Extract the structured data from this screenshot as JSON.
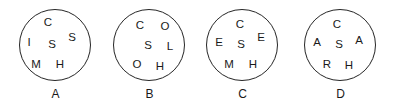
{
  "board": {
    "title": "Letter circles puzzle",
    "background_color": "#ffffff",
    "stroke_color": "#262626",
    "text_color": "#1a1a1a"
  },
  "circles": [
    {
      "label": "A",
      "letters": [
        {
          "char": "C",
          "x": 43,
          "y": 23
        },
        {
          "char": "S",
          "x": 67,
          "y": 38
        },
        {
          "char": "I",
          "x": 24,
          "y": 43
        },
        {
          "char": "S",
          "x": 47,
          "y": 45
        },
        {
          "char": "M",
          "x": 31,
          "y": 65
        },
        {
          "char": "H",
          "x": 55,
          "y": 65
        }
      ]
    },
    {
      "label": "B",
      "letters": [
        {
          "char": "C",
          "x": 41,
          "y": 26
        },
        {
          "char": "O",
          "x": 66,
          "y": 27
        },
        {
          "char": "S",
          "x": 49,
          "y": 46
        },
        {
          "char": "L",
          "x": 71,
          "y": 47
        },
        {
          "char": "O",
          "x": 38,
          "y": 65
        },
        {
          "char": "H",
          "x": 61,
          "y": 67
        }
      ]
    },
    {
      "label": "C",
      "letters": [
        {
          "char": "C",
          "x": 48,
          "y": 25
        },
        {
          "char": "E",
          "x": 69,
          "y": 38
        },
        {
          "char": "E",
          "x": 27,
          "y": 43
        },
        {
          "char": "S",
          "x": 49,
          "y": 45
        },
        {
          "char": "M",
          "x": 37,
          "y": 65
        },
        {
          "char": "H",
          "x": 61,
          "y": 65
        }
      ]
    },
    {
      "label": "D",
      "letters": [
        {
          "char": "C",
          "x": 47,
          "y": 25
        },
        {
          "char": "A",
          "x": 27,
          "y": 43
        },
        {
          "char": "S",
          "x": 49,
          "y": 45
        },
        {
          "char": "A",
          "x": 69,
          "y": 41
        },
        {
          "char": "R",
          "x": 37,
          "y": 65
        },
        {
          "char": "H",
          "x": 59,
          "y": 66
        }
      ]
    }
  ]
}
